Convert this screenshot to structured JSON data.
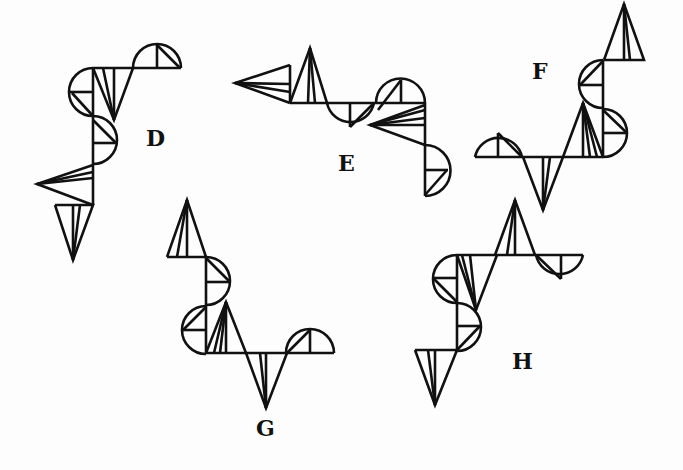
{
  "colors": {
    "ink": "#111111",
    "background": "#fdfdfd"
  },
  "figures": [
    {
      "id": "D",
      "label": "D",
      "label_pos": [
        146,
        135
      ],
      "lines": [
        [
          [
            93,
            68
          ],
          [
            181,
            68
          ]
        ],
        [
          [
            93,
            68
          ],
          [
            93,
            205
          ]
        ],
        [
          [
            93,
            68
          ],
          [
            114,
            120
          ],
          [
            133,
            68
          ]
        ],
        [
          [
            114,
            120
          ],
          [
            103,
            68
          ]
        ],
        [
          [
            114,
            120
          ],
          [
            114,
            68
          ]
        ],
        [
          [
            157,
            44
          ],
          [
            157,
            68
          ]
        ],
        [
          [
            157,
            45
          ],
          [
            180,
            68
          ]
        ],
        [
          [
            70,
            92
          ],
          [
            93,
            92
          ]
        ],
        [
          [
            72,
            93
          ],
          [
            93,
            116
          ]
        ],
        [
          [
            93,
            143
          ],
          [
            116,
            143
          ]
        ],
        [
          [
            93,
            120
          ],
          [
            116,
            143
          ]
        ],
        [
          [
            93,
            165
          ],
          [
            37,
            184
          ],
          [
            93,
            205
          ]
        ],
        [
          [
            37,
            184
          ],
          [
            93,
            172
          ]
        ],
        [
          [
            37,
            184
          ],
          [
            93,
            178
          ]
        ],
        [
          [
            55,
            205
          ],
          [
            93,
            205
          ],
          [
            73,
            260
          ],
          [
            55,
            205
          ]
        ],
        [
          [
            73,
            260
          ],
          [
            73,
            205
          ]
        ],
        [
          [
            73,
            260
          ],
          [
            80,
            205
          ]
        ]
      ],
      "arcs": [
        "M133,68 A24,24 0 0 1 181,68",
        "M93,68 A24,24 0 0 0 93,116",
        "M93,116 A24,24 0 0 1 93,164"
      ]
    },
    {
      "id": "E",
      "label": "E",
      "label_pos": [
        338,
        160
      ],
      "lines": [
        [
          [
            290,
            65
          ],
          [
            235,
            83
          ],
          [
            290,
            103
          ]
        ],
        [
          [
            290,
            65
          ],
          [
            290,
            103
          ]
        ],
        [
          [
            235,
            83
          ],
          [
            290,
            84
          ]
        ],
        [
          [
            235,
            83
          ],
          [
            290,
            92
          ]
        ],
        [
          [
            290,
            103
          ],
          [
            310,
            48
          ],
          [
            327,
            103
          ]
        ],
        [
          [
            310,
            48
          ],
          [
            308,
            103
          ]
        ],
        [
          [
            310,
            48
          ],
          [
            315,
            103
          ]
        ],
        [
          [
            290,
            103
          ],
          [
            425,
            103
          ]
        ],
        [
          [
            350,
            103
          ],
          [
            350,
            127
          ]
        ],
        [
          [
            350,
            127
          ],
          [
            374,
            103
          ]
        ],
        [
          [
            401,
            80
          ],
          [
            401,
            103
          ]
        ],
        [
          [
            378,
            110
          ],
          [
            401,
            80
          ]
        ],
        [
          [
            425,
            103
          ],
          [
            425,
            196
          ]
        ],
        [
          [
            425,
            105
          ],
          [
            370,
            125
          ],
          [
            425,
            145
          ]
        ],
        [
          [
            370,
            125
          ],
          [
            425,
            110
          ]
        ],
        [
          [
            370,
            125
          ],
          [
            425,
            118
          ]
        ],
        [
          [
            370,
            125
          ],
          [
            425,
            125
          ]
        ],
        [
          [
            425,
            170
          ],
          [
            448,
            170
          ]
        ],
        [
          [
            425,
            195
          ],
          [
            447,
            170
          ]
        ]
      ],
      "arcs": [
        "M327,103 A24,24 0 0 0 374,103",
        "M376,103 A24,24 0 0 1 425,103",
        "M425,145 A25,25 0 0 1 425,196"
      ]
    },
    {
      "id": "F",
      "label": "F",
      "label_pos": [
        532,
        68
      ],
      "lines": [
        [
          [
            604,
            60
          ],
          [
            644,
            60
          ],
          [
            624,
            4
          ],
          [
            604,
            60
          ]
        ],
        [
          [
            624,
            4
          ],
          [
            624,
            60
          ]
        ],
        [
          [
            624,
            4
          ],
          [
            630,
            60
          ]
        ],
        [
          [
            603,
            60
          ],
          [
            603,
            157
          ]
        ],
        [
          [
            580,
            85
          ],
          [
            603,
            85
          ]
        ],
        [
          [
            580,
            85
          ],
          [
            603,
            61
          ]
        ],
        [
          [
            603,
            133
          ],
          [
            627,
            133
          ]
        ],
        [
          [
            603,
            110
          ],
          [
            627,
            133
          ]
        ],
        [
          [
            475,
            157
          ],
          [
            603,
            157
          ]
        ],
        [
          [
            498,
            133
          ],
          [
            498,
            157
          ]
        ],
        [
          [
            498,
            133
          ],
          [
            522,
            157
          ]
        ],
        [
          [
            523,
            157
          ],
          [
            543,
            210
          ],
          [
            563,
            157
          ]
        ],
        [
          [
            543,
            210
          ],
          [
            543,
            157
          ]
        ],
        [
          [
            543,
            210
          ],
          [
            550,
            157
          ]
        ],
        [
          [
            563,
            157
          ],
          [
            583,
            103
          ],
          [
            603,
            157
          ]
        ],
        [
          [
            583,
            103
          ],
          [
            583,
            157
          ]
        ],
        [
          [
            583,
            103
          ],
          [
            590,
            157
          ]
        ],
        [
          [
            583,
            103
          ],
          [
            597,
            157
          ]
        ]
      ],
      "arcs": [
        "M603,60 A24,24 0 0 0 603,108",
        "M603,109 A24,24 0 0 1 603,157",
        "M475,157 A24,24 0 0 1 522,157"
      ]
    },
    {
      "id": "G",
      "label": "G",
      "label_pos": [
        256,
        425
      ],
      "lines": [
        [
          [
            167,
            257
          ],
          [
            206,
            257
          ],
          [
            187,
            200
          ],
          [
            167,
            257
          ]
        ],
        [
          [
            187,
            200
          ],
          [
            177,
            257
          ]
        ],
        [
          [
            187,
            200
          ],
          [
            187,
            257
          ]
        ],
        [
          [
            206,
            257
          ],
          [
            206,
            353
          ]
        ],
        [
          [
            206,
            282
          ],
          [
            230,
            282
          ]
        ],
        [
          [
            206,
            258
          ],
          [
            230,
            282
          ]
        ],
        [
          [
            183,
            330
          ],
          [
            206,
            330
          ]
        ],
        [
          [
            183,
            330
          ],
          [
            206,
            307
          ]
        ],
        [
          [
            206,
            353
          ],
          [
            334,
            353
          ]
        ],
        [
          [
            206,
            353
          ],
          [
            226,
            302
          ],
          [
            246,
            353
          ]
        ],
        [
          [
            226,
            302
          ],
          [
            214,
            353
          ]
        ],
        [
          [
            226,
            302
          ],
          [
            220,
            353
          ]
        ],
        [
          [
            226,
            302
          ],
          [
            226,
            353
          ]
        ],
        [
          [
            246,
            353
          ],
          [
            266,
            408
          ],
          [
            287,
            353
          ]
        ],
        [
          [
            266,
            408
          ],
          [
            260,
            353
          ]
        ],
        [
          [
            266,
            408
          ],
          [
            266,
            353
          ]
        ],
        [
          [
            310,
            330
          ],
          [
            310,
            353
          ]
        ],
        [
          [
            287,
            353
          ],
          [
            310,
            330
          ]
        ]
      ],
      "arcs": [
        "M206,257 A24,24 0 0 1 206,305",
        "M206,306 A24,24 0 0 0 206,354",
        "M286,353 A24,24 0 0 1 334,353"
      ]
    },
    {
      "id": "H",
      "label": "H",
      "label_pos": [
        512,
        358
      ],
      "lines": [
        [
          [
            495,
            255
          ],
          [
            515,
            200
          ],
          [
            535,
            255
          ]
        ],
        [
          [
            515,
            200
          ],
          [
            507,
            255
          ]
        ],
        [
          [
            515,
            200
          ],
          [
            515,
            255
          ]
        ],
        [
          [
            457,
            255
          ],
          [
            583,
            255
          ]
        ],
        [
          [
            561,
            255
          ],
          [
            561,
            279
          ]
        ],
        [
          [
            536,
            255
          ],
          [
            561,
            279
          ]
        ],
        [
          [
            433,
            278
          ],
          [
            457,
            278
          ]
        ],
        [
          [
            433,
            278
          ],
          [
            457,
            302
          ]
        ],
        [
          [
            457,
            255
          ],
          [
            476,
            310
          ],
          [
            497,
            255
          ]
        ],
        [
          [
            476,
            310
          ],
          [
            462,
            255
          ]
        ],
        [
          [
            476,
            310
          ],
          [
            470,
            255
          ]
        ],
        [
          [
            457,
            255
          ],
          [
            457,
            350
          ]
        ],
        [
          [
            457,
            326
          ],
          [
            480,
            326
          ]
        ],
        [
          [
            457,
            350
          ],
          [
            480,
            326
          ]
        ],
        [
          [
            415,
            350
          ],
          [
            457,
            350
          ],
          [
            435,
            405
          ],
          [
            415,
            350
          ]
        ],
        [
          [
            435,
            405
          ],
          [
            428,
            350
          ]
        ],
        [
          [
            435,
            405
          ],
          [
            435,
            350
          ]
        ]
      ],
      "arcs": [
        "M536,255 A24,24 0 0 0 583,255",
        "M457,255 A24,24 0 0 0 457,303",
        "M457,303 A24,24 0 0 1 457,351"
      ]
    }
  ]
}
